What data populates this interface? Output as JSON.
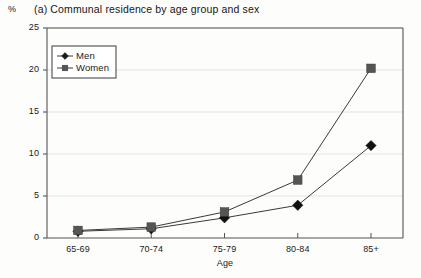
{
  "unit_label": "%",
  "title": "(a) Communal residence by age group and sex",
  "axis": {
    "x_title": "Age",
    "y_ticks": [
      "25",
      "20",
      "15",
      "10",
      "5",
      "0"
    ],
    "x_ticks": [
      "65-69",
      "70-74",
      "75-79",
      "80-84",
      "85+"
    ]
  },
  "legend": {
    "items": [
      {
        "label": "Men",
        "marker": "diamond",
        "color": "#1a1a1a"
      },
      {
        "label": "Women",
        "marker": "square",
        "color": "#555555"
      }
    ]
  },
  "colors": {
    "line": "#3a3a3a",
    "men_marker": "#111111",
    "women_marker": "#555555",
    "axis": "#555555",
    "grid": "#d8d8d8"
  },
  "chart_data": {
    "type": "line",
    "title": "(a) Communal residence by age group and sex",
    "xlabel": "Age",
    "ylabel": "%",
    "categories": [
      "65-69",
      "70-74",
      "75-79",
      "80-84",
      "85+"
    ],
    "ylim": [
      0,
      25
    ],
    "yticks": [
      0,
      5,
      10,
      15,
      20,
      25
    ],
    "grid": true,
    "legend_position": "upper-left-inside",
    "series": [
      {
        "name": "Men",
        "marker": "diamond",
        "values": [
          0.8,
          1.1,
          2.4,
          3.9,
          11.0
        ]
      },
      {
        "name": "Women",
        "marker": "square",
        "values": [
          0.9,
          1.3,
          3.1,
          6.9,
          20.2
        ]
      }
    ]
  }
}
